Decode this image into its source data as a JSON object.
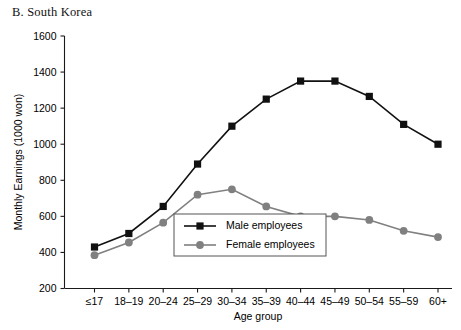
{
  "panel": {
    "title": "B. South Korea"
  },
  "chart_data": {
    "type": "line",
    "title": "B. South Korea",
    "xlabel": "Age group",
    "ylabel": "Monthly Earnings (1000 won)",
    "ylim": [
      200,
      1600
    ],
    "yticks": [
      200,
      400,
      600,
      800,
      1000,
      1200,
      1400,
      1600
    ],
    "grid": false,
    "legend_position": "inside-bottom-center",
    "categories": [
      "≤17",
      "18–19",
      "20–24",
      "25–29",
      "30–34",
      "35–39",
      "40–44",
      "45–49",
      "50–54",
      "55–59",
      "60+"
    ],
    "series": [
      {
        "name": "Male employees",
        "color": "#111111",
        "marker": "square",
        "values": [
          430,
          505,
          655,
          890,
          1100,
          1250,
          1350,
          1350,
          1265,
          1110,
          1000
        ]
      },
      {
        "name": "Female employees",
        "color": "#808080",
        "marker": "circle",
        "values": [
          385,
          455,
          565,
          720,
          750,
          655,
          600,
          600,
          580,
          520,
          485
        ]
      }
    ]
  },
  "legend": {
    "items": [
      {
        "label": "Male employees",
        "color": "#111111",
        "marker": "square"
      },
      {
        "label": "Female employees",
        "color": "#808080",
        "marker": "circle"
      }
    ]
  }
}
